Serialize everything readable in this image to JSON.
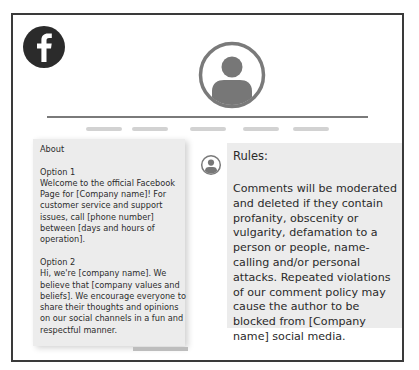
{
  "logo": {
    "icon": "facebook-f-icon",
    "color": "#2b2b2b"
  },
  "profile": {
    "icon": "user-avatar-icon",
    "color": "#777777"
  },
  "nav": {
    "placeholders": [
      {
        "left": 86,
        "width": 36
      },
      {
        "left": 132,
        "width": 36
      },
      {
        "left": 190,
        "width": 36
      },
      {
        "left": 243,
        "width": 36
      },
      {
        "left": 293,
        "width": 36
      }
    ]
  },
  "about": {
    "heading": "About",
    "option1_title": "Option 1",
    "option1_text": "Welcome to the official Facebook Page for [Company name]! For customer service and support issues, call [phone number] between [days and hours of operation].",
    "option2_title": "Option 2",
    "option2_text": "Hi, we're [company name]. We believe that [company values and beliefs]. We encourage everyone to share their thoughts and opinions on our social channels in a fun and respectful manner."
  },
  "rules": {
    "title": "Rules:",
    "body": "Comments will be moderated and deleted if they contain profanity, obscenity or vulgarity, defamation to a person or people, name-calling and/or personal attacks. Repeated violations of our comment policy may cause the author to be blocked from [Company name] social media."
  },
  "colors": {
    "frame_border": "#3a3a3a",
    "panel_bg": "#ececec",
    "icon_gray": "#777777",
    "text": "#2d2d2d"
  }
}
